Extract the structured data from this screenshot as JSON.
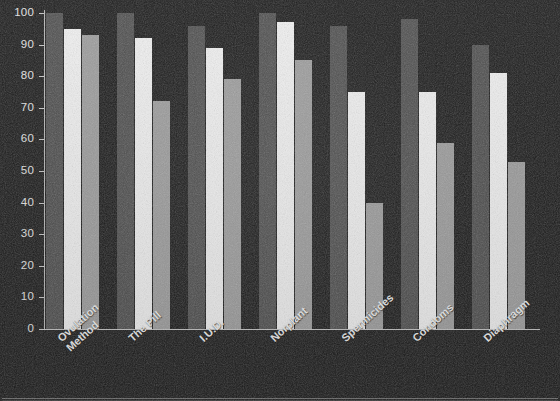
{
  "chart_data": {
    "type": "bar",
    "title": "",
    "xlabel": "",
    "ylabel": "",
    "ylim": [
      0,
      100
    ],
    "yticks": [
      0,
      10,
      20,
      30,
      40,
      50,
      60,
      70,
      80,
      90,
      100
    ],
    "grid": false,
    "legend": "none",
    "categories": [
      "Ovulation Method",
      "The Pill",
      "I.U.D.",
      "Norplant",
      "Spermicides",
      "Condoms",
      "Diaphragm"
    ],
    "category_lines": [
      [
        "Ovulation",
        "Method"
      ],
      [
        "The Pill"
      ],
      [
        "I.U.D."
      ],
      [
        "Norplant"
      ],
      [
        "Spermicides"
      ],
      [
        "Condoms"
      ],
      [
        "Diaphragm"
      ]
    ],
    "series": [
      {
        "name": "series-1",
        "color": "#4e4e4e",
        "values": [
          100,
          100,
          96,
          100,
          96,
          98,
          90
        ]
      },
      {
        "name": "series-2",
        "color": "#f2f2f2",
        "values": [
          95,
          92,
          89,
          97,
          75,
          75,
          81
        ]
      },
      {
        "name": "series-3",
        "color": "#9d9d9d",
        "values": [
          93,
          72,
          79,
          85,
          40,
          59,
          53
        ]
      }
    ]
  },
  "colors": {
    "background": "#1b1b1b",
    "axis": "#c3c3c3",
    "tick_text": "#e6e6e6",
    "label_text": "#f0f0f0",
    "series_1": "#4e4e4e",
    "series_2": "#f2f2f2",
    "series_3": "#9d9d9d",
    "frame": "#6e6e6e"
  },
  "layout": {
    "plot_left": 44,
    "plot_right": 540,
    "baseline_y": 329,
    "top_y": 13,
    "group_starts": [
      46,
      117,
      188,
      259,
      330,
      401,
      472
    ],
    "bar_width": 17,
    "bar_gap": 1
  }
}
